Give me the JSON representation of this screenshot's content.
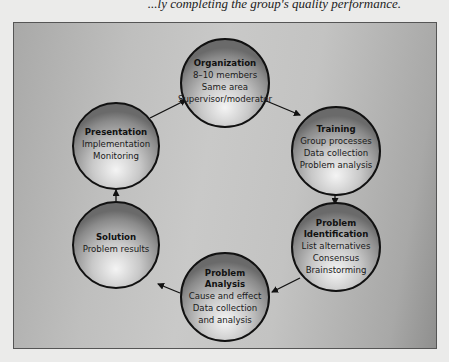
{
  "header": {
    "text": "...ly completing the group's quality performance."
  },
  "diagram": {
    "type": "cycle",
    "colors": {
      "panel_light": "#c9c9c8",
      "panel_dark": "#8f8f8e",
      "circle_light": "#f2f2f2",
      "circle_dark": "#6e6e6e",
      "outline": "#111111"
    },
    "nodes": [
      {
        "id": "organization",
        "title": "Organization",
        "lines": [
          "8–10 members",
          "Same area",
          "Supervisor/moderator"
        ]
      },
      {
        "id": "training",
        "title": "Training",
        "lines": [
          "Group processes",
          "Data collection",
          "Problem analysis"
        ]
      },
      {
        "id": "problem-identification",
        "title_lines": [
          "Problem",
          "Identification"
        ],
        "lines": [
          "List alternatives",
          "Consensus",
          "Brainstorming"
        ]
      },
      {
        "id": "problem-analysis",
        "title_lines": [
          "Problem",
          "Analysis"
        ],
        "lines": [
          "Cause and effect",
          "Data collection",
          "and analysis"
        ]
      },
      {
        "id": "solution",
        "title": "Solution",
        "lines": [
          "Problem results"
        ]
      },
      {
        "id": "presentation",
        "title": "Presentation",
        "lines": [
          "Implementation",
          "Monitoring"
        ]
      }
    ],
    "edges": [
      {
        "from": "organization",
        "to": "training"
      },
      {
        "from": "training",
        "to": "problem-identification"
      },
      {
        "from": "problem-identification",
        "to": "problem-analysis"
      },
      {
        "from": "problem-analysis",
        "to": "solution"
      },
      {
        "from": "solution",
        "to": "presentation"
      },
      {
        "from": "presentation",
        "to": "organization"
      }
    ]
  }
}
